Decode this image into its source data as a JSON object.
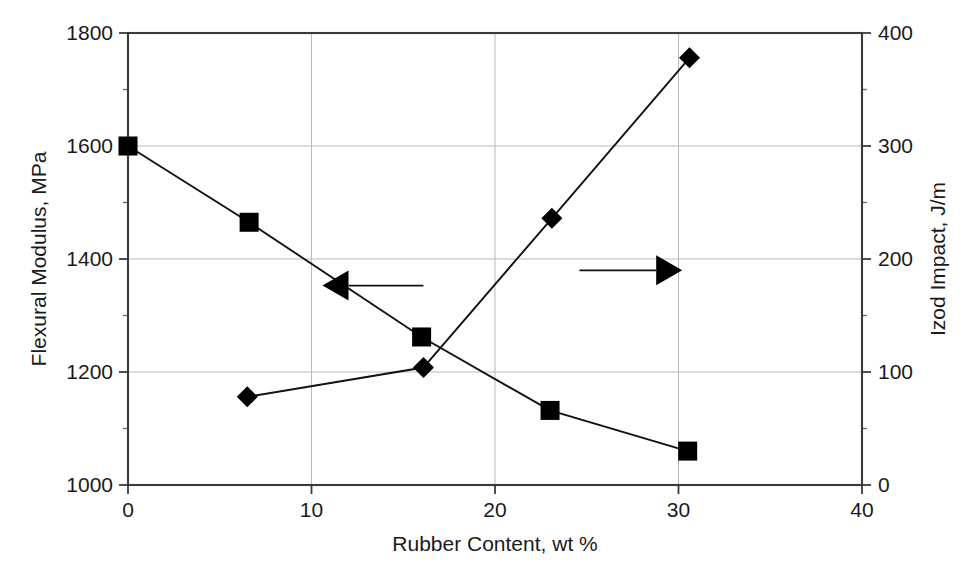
{
  "chart_data": {
    "type": "line",
    "title": "",
    "xlabel": "Rubber Content, wt %",
    "ylabel": "Flexural Modulus, MPa",
    "y2label": "Izod Impact, J/m",
    "xlim": [
      0,
      40
    ],
    "ylim": [
      1000,
      1800
    ],
    "y2lim": [
      0,
      400
    ],
    "xticks": [
      "0",
      "10",
      "20",
      "30",
      "40"
    ],
    "xtick_values": [
      0,
      10,
      20,
      30,
      40
    ],
    "yticks": [
      "1000",
      "1200",
      "1400",
      "1600",
      "1800"
    ],
    "ytick_values": [
      1000,
      1200,
      1400,
      1600,
      1800
    ],
    "y2ticks": [
      "0",
      "100",
      "200",
      "300",
      "400"
    ],
    "y2tick_values": [
      0,
      100,
      200,
      300,
      400
    ],
    "grid": true,
    "legend": "none",
    "series": [
      {
        "name": "Flexural Modulus",
        "axis": "left",
        "marker": "square",
        "x": [
          0.0,
          6.6,
          16.0,
          23.0,
          30.5
        ],
        "values": [
          1600,
          1465,
          1262,
          1132,
          1060
        ]
      },
      {
        "name": "Izod Impact",
        "axis": "right",
        "marker": "diamond",
        "x": [
          6.5,
          16.1,
          23.1,
          30.6
        ],
        "values": [
          78,
          104,
          236,
          378
        ]
      }
    ],
    "annotations": [
      {
        "name": "left-arrow-annotation",
        "direction": "left",
        "points_to": "Flexural Modulus",
        "x_start": 16.1,
        "x_end": 10.6,
        "y_value": 1353
      },
      {
        "name": "right-arrow-annotation",
        "direction": "right",
        "points_to": "Izod Impact",
        "x_start": 24.6,
        "x_end": 30.2,
        "y_value": 190
      }
    ]
  },
  "axes": {
    "left_title": "Flexural Modulus, MPa",
    "right_title": "Izod Impact, J/m",
    "bottom_title": "Rubber Content, wt %"
  }
}
